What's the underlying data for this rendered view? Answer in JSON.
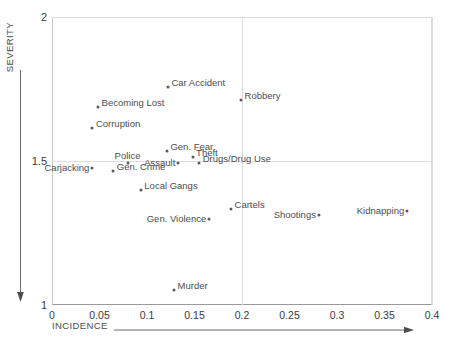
{
  "chart_data": {
    "type": "scatter",
    "title": "",
    "xlabel": "INCIDENCE",
    "ylabel": "SEVERITY",
    "xlim": [
      0,
      0.4
    ],
    "ylim": [
      1,
      2
    ],
    "grid": true,
    "legend": "none",
    "xticks": [
      "0",
      "0.05",
      "0.1",
      "0.15",
      "0.2",
      "0.25",
      "0.3",
      "0.35",
      "0.4"
    ],
    "xtick_values": [
      0,
      0.05,
      0.1,
      0.15,
      0.2,
      0.25,
      0.3,
      0.35,
      0.4
    ],
    "yticks": [
      "1",
      "1.5",
      "2"
    ],
    "ytick_values": [
      1,
      1.5,
      2
    ],
    "gridlines_x": [
      0.2,
      0.4
    ],
    "gridlines_y": [
      1.5,
      2
    ],
    "points": [
      {
        "label": "Car Accident",
        "x": 0.122,
        "y": 1.757,
        "label_pos": "right"
      },
      {
        "label": "Robbery",
        "x": 0.199,
        "y": 1.713,
        "label_pos": "right"
      },
      {
        "label": "Becoming Lost",
        "x": 0.0485,
        "y": 1.688,
        "label_pos": "right"
      },
      {
        "label": "Corruption",
        "x": 0.0425,
        "y": 1.615,
        "label_pos": "right"
      },
      {
        "label": "Gen. Fear",
        "x": 0.121,
        "y": 1.535,
        "label_pos": "right"
      },
      {
        "label": "Theft",
        "x": 0.148,
        "y": 1.513,
        "label_pos": "right"
      },
      {
        "label": "Drugs/Drug Use",
        "x": 0.155,
        "y": 1.492,
        "label_pos": "right"
      },
      {
        "label": "Police",
        "x": 0.0795,
        "y": 1.492,
        "label_pos": "above"
      },
      {
        "label": "Assault",
        "x": 0.133,
        "y": 1.492,
        "label_pos": "left"
      },
      {
        "label": "Carjacking",
        "x": 0.0425,
        "y": 1.476,
        "label_pos": "left"
      },
      {
        "label": "Gen. Crime",
        "x": 0.0645,
        "y": 1.466,
        "label_pos": "right"
      },
      {
        "label": "Local Gangs",
        "x": 0.0935,
        "y": 1.4,
        "label_pos": "right"
      },
      {
        "label": "Cartels",
        "x": 0.1885,
        "y": 1.333,
        "label_pos": "right"
      },
      {
        "label": "Kidnapping",
        "x": 0.374,
        "y": 1.325,
        "label_pos": "left"
      },
      {
        "label": "Shootings",
        "x": 0.281,
        "y": 1.313,
        "label_pos": "left"
      },
      {
        "label": "Gen. Violence",
        "x": 0.1655,
        "y": 1.298,
        "label_pos": "left"
      },
      {
        "label": "Murder",
        "x": 0.1285,
        "y": 1.053,
        "label_pos": "right"
      }
    ]
  },
  "axes": {
    "severity_label": "SEVERITY",
    "incidence_label": "INCIDENCE"
  },
  "colors": {
    "point": "#5a5a5a",
    "grid": "#dddddd",
    "axis": "#9a9a9a",
    "text": "#4d4d4d"
  }
}
